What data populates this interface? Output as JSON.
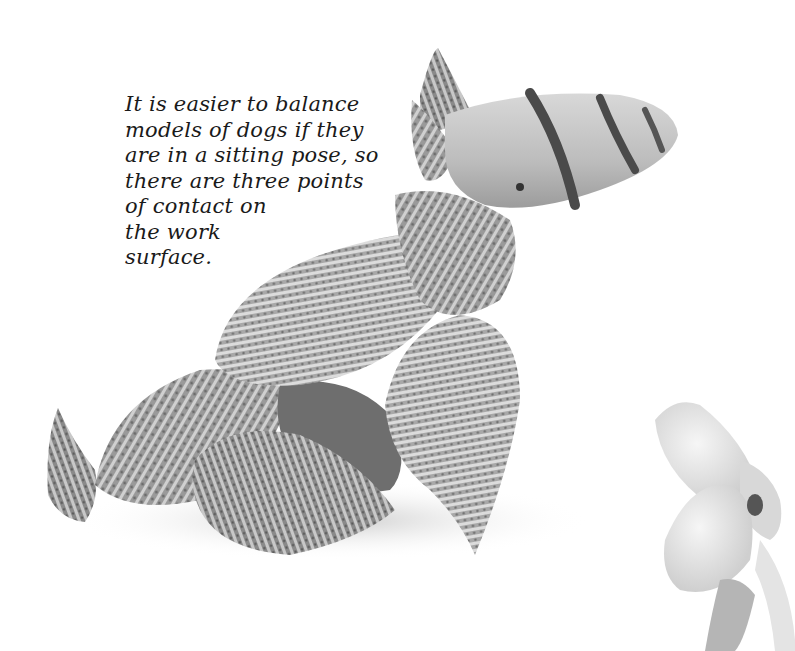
{
  "page": {
    "caption_lines": [
      "It is easier to balance",
      "models of dogs if they",
      "are in a sitting pose, so",
      "there are three points",
      "of contact on",
      "the work",
      "surface."
    ]
  },
  "images": {
    "main": "shell-dog-model",
    "secondary": "white-shell-figure"
  }
}
